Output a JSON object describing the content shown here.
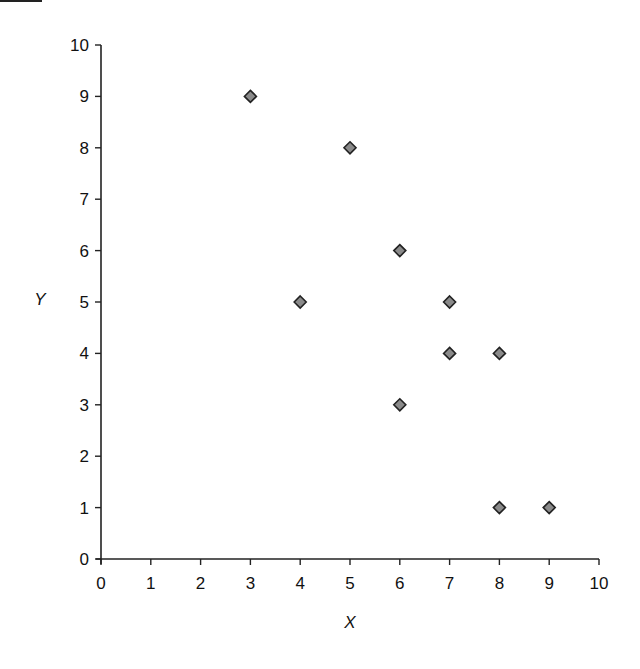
{
  "chart_data": {
    "type": "scatter",
    "title": "",
    "xlabel": "X",
    "ylabel": "Y",
    "xlim": [
      0,
      10
    ],
    "ylim": [
      0,
      10
    ],
    "xticks": [
      0,
      1,
      2,
      3,
      4,
      5,
      6,
      7,
      8,
      9,
      10
    ],
    "yticks": [
      0,
      1,
      2,
      3,
      4,
      5,
      6,
      7,
      8,
      9,
      10
    ],
    "grid": false,
    "legend": null,
    "marker": "diamond",
    "marker_fill": "#8a8a8a",
    "marker_edge": "#222222",
    "series": [
      {
        "name": "points",
        "x": [
          3,
          5,
          6,
          4,
          7,
          7,
          8,
          6,
          8,
          9
        ],
        "y": [
          9,
          8,
          6,
          5,
          5,
          4,
          4,
          3,
          1,
          1
        ]
      }
    ]
  }
}
